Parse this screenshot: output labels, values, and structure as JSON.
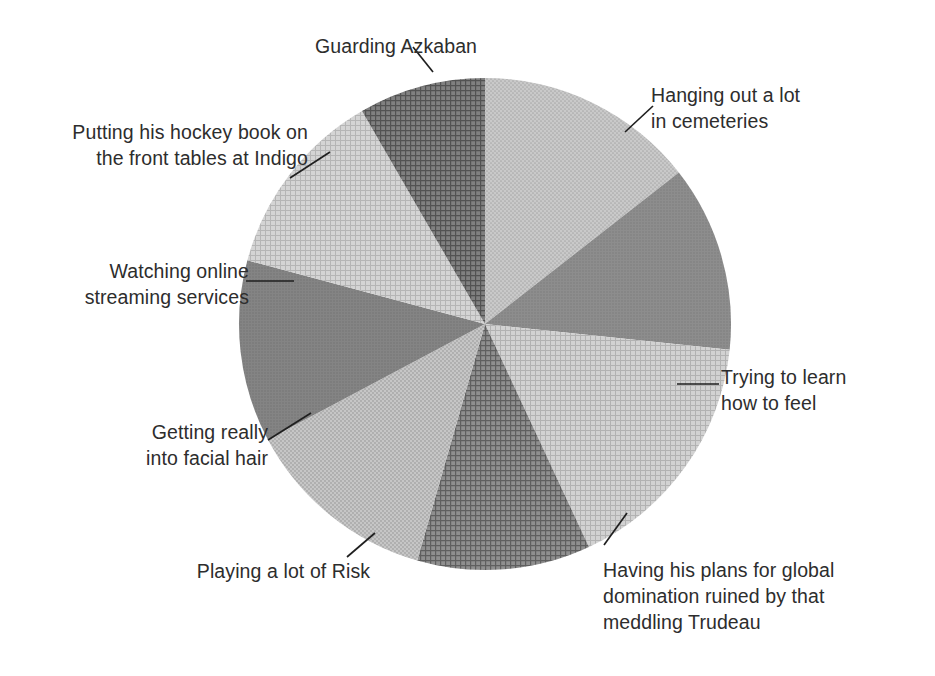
{
  "chart_data": {
    "type": "pie",
    "title": "",
    "subtitle": "",
    "xlabel": "",
    "ylabel": "",
    "grid": false,
    "legend_position": "none",
    "label_style": "leader-line callouts outside slices",
    "center": {
      "x": 485,
      "y": 324
    },
    "radius": 246,
    "start_angle_deg": 0,
    "direction": "clockwise",
    "total_slices": 8,
    "categories": [
      "Hanging out a lot in cemeteries",
      "Trying to learn how to feel",
      "Having his plans for global domination ruined by that meddling Trudeau",
      "Playing a lot of Risk",
      "Getting really into facial hair",
      "Watching online streaming services",
      "Putting his hockey book on the front tables at Indigo",
      "Guarding Azkaban"
    ],
    "values": [
      14.4,
      12.2,
      16.4,
      11.4,
      12.8,
      11.9,
      12.5,
      8.4
    ],
    "angles_deg": [
      52,
      44,
      59,
      41,
      46,
      43,
      45,
      30
    ],
    "slices": [
      {
        "label": "Hanging out a lot in cemeteries",
        "value": 14.4,
        "start_angle_deg": 0,
        "end_angle_deg": 52,
        "fill": "#b4b4b4",
        "pattern": "fine-dot"
      },
      {
        "label": "Trying to learn how to feel",
        "value": 12.2,
        "start_angle_deg": 52,
        "end_angle_deg": 96,
        "fill": "#8e8e8e",
        "pattern": "solid-dot"
      },
      {
        "label": "Having his plans for global domination ruined by that meddling Trudeau",
        "value": 16.4,
        "start_angle_deg": 96,
        "end_angle_deg": 155,
        "fill": "#c2c2c2",
        "pattern": "crosshatch-light"
      },
      {
        "label": "Playing a lot of Risk",
        "value": 11.4,
        "start_angle_deg": 155,
        "end_angle_deg": 196,
        "fill": "#7f7f7f",
        "pattern": "coarse-crosshatch"
      },
      {
        "label": "Getting really into facial hair",
        "value": 12.8,
        "start_angle_deg": 196,
        "end_angle_deg": 242,
        "fill": "#b9b9b9",
        "pattern": "fine-dot"
      },
      {
        "label": "Watching online streaming services",
        "value": 11.9,
        "start_angle_deg": 242,
        "end_angle_deg": 285,
        "fill": "#858585",
        "pattern": "solid-dot"
      },
      {
        "label": "Putting his hockey book on the front tables at Indigo",
        "value": 12.5,
        "start_angle_deg": 285,
        "end_angle_deg": 330,
        "fill": "#c4c4c4",
        "pattern": "crosshatch-light"
      },
      {
        "label": "Guarding Azkaban",
        "value": 8.4,
        "start_angle_deg": 330,
        "end_angle_deg": 360,
        "fill": "#6f6f6f",
        "pattern": "coarse-crosshatch"
      }
    ]
  },
  "labels": {
    "azkaban": "Guarding Azkaban",
    "indigo": "Putting his hockey book on\nthe front tables at Indigo",
    "streaming": "Watching online\nstreaming services",
    "facial_hair": "Getting really\ninto facial hair",
    "risk": "Playing a lot of Risk",
    "trudeau": "Having his plans for global\ndomination ruined by that\nmeddling Trudeau",
    "feel": "Trying to learn\nhow to feel",
    "cemeteries": "Hanging out a lot\nin cemeteries"
  },
  "colors": {
    "background": "#ffffff",
    "text": "#2d2d2d",
    "leader_line": "#1f1f1f",
    "slice_light": "#c4c4c4",
    "slice_mid": "#b4b4b4",
    "slice_dark": "#7f7f7f",
    "slice_darkest": "#6f6f6f"
  }
}
